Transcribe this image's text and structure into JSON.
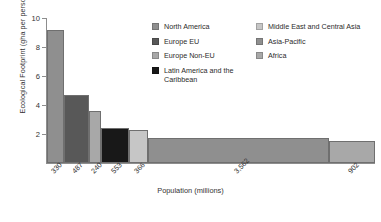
{
  "chart_data": {
    "type": "bar",
    "title": "",
    "xlabel": "Population (millions)",
    "ylabel": "Ecological Footprint (gha per person)",
    "ylim": [
      0,
      10
    ],
    "yticks": [
      "2",
      "4",
      "6",
      "8",
      "10"
    ],
    "grid": false,
    "legend_position": "top-right",
    "note": "Bar widths are proportional to population (millions); bar heights are ecological footprint in gha per person.",
    "categories": [
      "North America",
      "Europe EU",
      "Europe Non-EU",
      "Latin America and the Caribbean",
      "Middle East and Central Asia",
      "Asia-Pacific",
      "Africa"
    ],
    "values": [
      9.2,
      4.7,
      3.6,
      2.4,
      2.3,
      1.7,
      1.5
    ],
    "widths": [
      330,
      487,
      240,
      553,
      366,
      3562,
      902
    ],
    "xtick_labels": [
      "330",
      "487",
      "240",
      "553",
      "366",
      "3,562",
      "902"
    ],
    "colors": [
      "#8f8f8f",
      "#585858",
      "#a8a8a8",
      "#181818",
      "#c6c6c6",
      "#8f8f8f",
      "#a8a8a8"
    ]
  },
  "axes": {
    "y_title": "Ecological Footprint (gha per person)",
    "x_title": "Population (millions)",
    "y_tick_0": "2",
    "y_tick_1": "4",
    "y_tick_2": "6",
    "y_tick_3": "8",
    "y_tick_4": "10"
  },
  "legend": {
    "left_column": [
      {
        "label": "North America",
        "color": "#8f8f8f"
      },
      {
        "label": "Europe EU",
        "color": "#585858"
      },
      {
        "label": "Europe Non-EU",
        "color": "#a8a8a8"
      },
      {
        "label": "Latin America and the Caribbean",
        "color": "#181818"
      }
    ],
    "right_column": [
      {
        "label": "Middle East and Central Asia",
        "color": "#c6c6c6"
      },
      {
        "label": "Asia-Pacific",
        "color": "#8f8f8f"
      },
      {
        "label": "Africa",
        "color": "#a8a8a8"
      }
    ]
  }
}
